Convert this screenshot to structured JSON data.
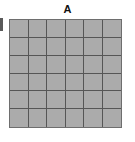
{
  "panel": {
    "title": "A",
    "title_icon": "none"
  },
  "chart_data": {
    "type": "heatmap",
    "title": "A",
    "xlabel": "",
    "ylabel": "",
    "rows": 6,
    "cols": 6,
    "grid": true,
    "legend": "none",
    "xticklabels": [],
    "yticklabels": [],
    "values": [
      [
        1,
        1,
        1,
        1,
        1,
        1
      ],
      [
        1,
        1,
        1,
        1,
        1,
        1
      ],
      [
        1,
        1,
        1,
        1,
        1,
        1
      ],
      [
        1,
        1,
        1,
        1,
        1,
        1
      ],
      [
        1,
        1,
        1,
        1,
        1,
        1
      ],
      [
        1,
        1,
        1,
        1,
        1,
        1
      ]
    ],
    "colors": {
      "cell_fill": "#ababab",
      "gridline": "#565656",
      "panel_border": "#6e6e6e",
      "background": "#ffffff",
      "title_color": "#111111",
      "edge_sliver": "#5a5a5a"
    }
  }
}
